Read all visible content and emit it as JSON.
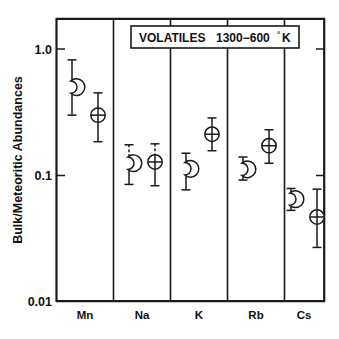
{
  "figure": {
    "title_box": {
      "label_main": "VOLATILES",
      "label_range": "1300−600",
      "label_degree": "°",
      "label_unit": "K",
      "full_text": "VOLATILES   1300−600°K"
    },
    "background_color": "#ffffff",
    "ink_color": "#1a1a1a"
  },
  "chart_data": {
    "type": "scatter",
    "xlabel": "",
    "ylabel": "Bulk/Meteoritic Abundances",
    "yscale": "log",
    "ylim": [
      0.01,
      2.0
    ],
    "ytick_values": [
      1.0,
      0.1,
      0.01
    ],
    "ytick_labels": [
      "1.0",
      "0.1",
      "0.01"
    ],
    "grid": false,
    "legend_position": "none",
    "categories": [
      "Mn",
      "Na",
      "K",
      "Rb",
      "Cs"
    ],
    "series": [
      {
        "name": "Moon",
        "marker": "crescent-moon",
        "values": [
          0.5,
          0.125,
          0.113,
          0.112,
          0.065
        ],
        "err_low": [
          0.3,
          0.085,
          0.077,
          0.092,
          0.053
        ],
        "err_high": [
          0.82,
          0.175,
          0.15,
          0.14,
          0.079
        ],
        "err_high_dashed": [
          false,
          true,
          false,
          false,
          false
        ]
      },
      {
        "name": "Earth",
        "marker": "earth-circle-cross",
        "values": [
          0.3,
          0.128,
          0.212,
          0.172,
          0.047
        ],
        "err_low": [
          0.185,
          0.083,
          0.157,
          0.125,
          0.027
        ],
        "err_high": [
          0.45,
          0.178,
          0.285,
          0.23,
          0.078
        ],
        "err_high_dashed": [
          false,
          true,
          false,
          false,
          false
        ]
      }
    ]
  },
  "axes": {
    "y_axis_title": "Bulk/Meteoritic Abundances",
    "y_ticks": [
      {
        "label": "1.0",
        "value": 1.0
      },
      {
        "label": "0.1",
        "value": 0.1
      },
      {
        "label": "0.01",
        "value": 0.01
      }
    ],
    "x_categories": [
      {
        "label": "Mn"
      },
      {
        "label": "Na"
      },
      {
        "label": "K"
      },
      {
        "label": "Rb"
      },
      {
        "label": "Cs"
      }
    ]
  }
}
